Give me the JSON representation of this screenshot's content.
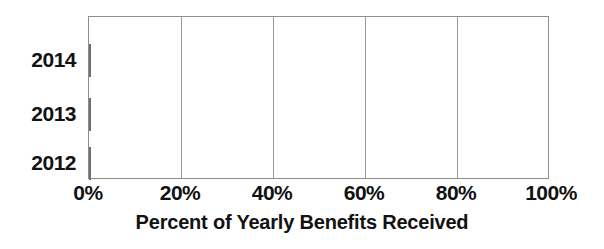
{
  "chart_data": {
    "type": "bar",
    "orientation": "horizontal",
    "title": "",
    "subtitle": "",
    "xlabel": "Percent of Yearly Benefits Received",
    "ylabel": "",
    "categories": [
      "2014",
      "2013",
      "2012"
    ],
    "values": [
      87,
      68,
      55
    ],
    "value_suffix": "%",
    "xlim": [
      0,
      100
    ],
    "xticks": [
      0,
      20,
      40,
      60,
      80,
      100
    ],
    "xtick_labels": [
      "0%",
      "20%",
      "40%",
      "60%",
      "80%",
      "100%"
    ],
    "grid": true,
    "grid_axis": "x",
    "legend": false,
    "legend_position": "none",
    "series": [
      {
        "name": "Percent of Yearly Benefits Received",
        "color": "#858585",
        "values": [
          87,
          68,
          55
        ]
      }
    ],
    "annotations": [],
    "colors": {
      "bar_fill": "#858585",
      "bar_border": "#6f6f6f",
      "gridline": "#9a9a9a",
      "axis_frame": "#8e8e8e",
      "text": "#121212",
      "background": "#ffffff"
    }
  }
}
